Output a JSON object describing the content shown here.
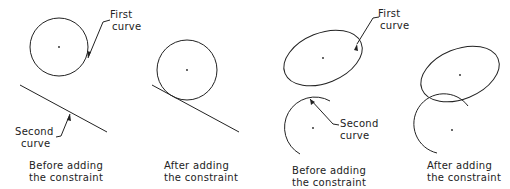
{
  "panels": [
    {
      "id": "tangent-before",
      "caption": [
        "Before adding",
        "the constraint"
      ],
      "first_label": [
        "First",
        "curve"
      ],
      "second_label": [
        "Second",
        "curve"
      ]
    },
    {
      "id": "tangent-after",
      "caption": [
        "After adding",
        "the constraint"
      ]
    },
    {
      "id": "ellipse-before",
      "caption": [
        "Before adding",
        "the constraint"
      ],
      "first_label": [
        "First",
        "curve"
      ],
      "second_label": [
        "Second",
        "curve"
      ]
    },
    {
      "id": "ellipse-after",
      "caption": [
        "After adding",
        "the constraint"
      ]
    }
  ],
  "colors": {
    "stroke": "#222222",
    "background": "#ffffff"
  }
}
